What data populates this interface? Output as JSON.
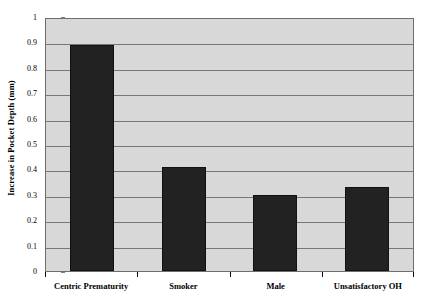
{
  "chart_data": {
    "type": "bar",
    "title": "",
    "xlabel": "",
    "ylabel": "Increase in Pocket Depth (mm)",
    "categories": [
      "Centric Prematurity",
      "Smoker",
      "Male",
      "Unsatisfactory OH"
    ],
    "values": [
      0.89,
      0.41,
      0.3,
      0.33
    ],
    "ylim": [
      0,
      1
    ],
    "ytick_labels": [
      "1",
      "0.9",
      "0.8",
      "0.7",
      "0.6",
      "0.5",
      "0.4",
      "0.3",
      "0.2",
      "0.1",
      "0"
    ],
    "ytick_values": [
      1,
      0.9,
      0.8,
      0.7,
      0.6,
      0.5,
      0.4,
      0.3,
      0.2,
      0.1,
      0
    ],
    "grid": true,
    "legend": "none",
    "colors": {
      "bar": "#222222",
      "plot_background": "#d8d8d8",
      "gridline": "#787878",
      "axis": "#000000",
      "page_background": "#ffffff"
    }
  }
}
